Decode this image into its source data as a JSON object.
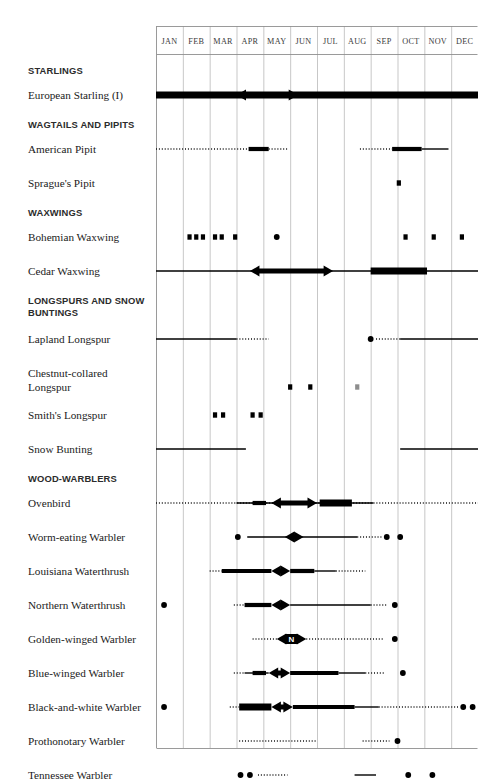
{
  "chart_data": {
    "type": "table",
    "xlabel": "",
    "ylabel": "",
    "grid": true,
    "legend_position": "none",
    "categories": [
      "JAN",
      "FEB",
      "MAR",
      "APR",
      "MAY",
      "JUN",
      "JUL",
      "AUG",
      "SEP",
      "OCT",
      "NOV",
      "DEC"
    ],
    "axis_range_months": [
      1,
      13
    ],
    "notation": {
      "thick_bar": "abundant / common",
      "thin_line": "uncommon",
      "dotted_line": "rare / occasional",
      "dot": "isolated record",
      "square": "isolated record",
      "double_arrow": "migration peak",
      "N_glyph": "nesting"
    },
    "groups": [
      {
        "group": "STARLINGS",
        "species": [
          {
            "name": "European Starling (I)",
            "marks": [
              {
                "kind": "bar",
                "start": 1.0,
                "end": 13.0,
                "weight": "thick"
              },
              {
                "kind": "arrows",
                "start": 4.0,
                "end": 6.3
              }
            ]
          }
        ]
      },
      {
        "group": "WAGTAILS AND PIPITS",
        "species": [
          {
            "name": "American Pipit",
            "marks": [
              {
                "kind": "line",
                "start": 1.0,
                "end": 4.45,
                "weight": "dotted"
              },
              {
                "kind": "bar",
                "start": 4.45,
                "end": 5.2,
                "weight": "medium"
              },
              {
                "kind": "line",
                "start": 5.2,
                "end": 5.9,
                "weight": "dotted"
              },
              {
                "kind": "line",
                "start": 8.6,
                "end": 9.8,
                "weight": "dotted"
              },
              {
                "kind": "bar",
                "start": 9.8,
                "end": 10.9,
                "weight": "medium"
              },
              {
                "kind": "line",
                "start": 10.9,
                "end": 11.9,
                "weight": "thin"
              }
            ]
          },
          {
            "name": "Sprague's Pipit",
            "marks": [
              {
                "kind": "square",
                "at": 10.05
              }
            ]
          }
        ]
      },
      {
        "group": "WAXWINGS",
        "species": [
          {
            "name": "Bohemian Waxwing",
            "marks": [
              {
                "kind": "square",
                "at": 2.25
              },
              {
                "kind": "square",
                "at": 2.5
              },
              {
                "kind": "square",
                "at": 2.75
              },
              {
                "kind": "square",
                "at": 3.2
              },
              {
                "kind": "square",
                "at": 3.45
              },
              {
                "kind": "square",
                "at": 3.95
              },
              {
                "kind": "dot",
                "at": 5.5
              },
              {
                "kind": "square",
                "at": 10.3
              },
              {
                "kind": "square",
                "at": 11.35
              },
              {
                "kind": "square",
                "at": 12.4
              }
            ]
          },
          {
            "name": "Cedar Waxwing",
            "marks": [
              {
                "kind": "line",
                "start": 1.0,
                "end": 13.0,
                "weight": "thin"
              },
              {
                "kind": "arrows",
                "start": 4.5,
                "end": 7.6
              },
              {
                "kind": "bar",
                "start": 9.0,
                "end": 11.1,
                "weight": "thick"
              }
            ]
          }
        ]
      },
      {
        "group": "LONGSPURS AND SNOW BUNTINGS",
        "species": [
          {
            "name": "Lapland Longspur",
            "marks": [
              {
                "kind": "line",
                "start": 1.0,
                "end": 4.0,
                "weight": "thin"
              },
              {
                "kind": "line",
                "start": 4.0,
                "end": 5.2,
                "weight": "dotted"
              },
              {
                "kind": "dot",
                "at": 9.0
              },
              {
                "kind": "line",
                "start": 9.2,
                "end": 10.1,
                "weight": "dotted"
              },
              {
                "kind": "line",
                "start": 10.1,
                "end": 13.0,
                "weight": "thin"
              }
            ]
          },
          {
            "name": "Chestnut-collared Longspur",
            "marks": [
              {
                "kind": "square",
                "at": 6.0
              },
              {
                "kind": "square",
                "at": 6.75
              },
              {
                "kind": "square",
                "at": 8.5,
                "faint": true
              }
            ]
          },
          {
            "name": "Smith's Longspur",
            "marks": [
              {
                "kind": "square",
                "at": 3.2
              },
              {
                "kind": "square",
                "at": 3.5
              },
              {
                "kind": "square",
                "at": 4.6
              },
              {
                "kind": "square",
                "at": 4.9
              }
            ]
          },
          {
            "name": "Snow Bunting",
            "marks": [
              {
                "kind": "line",
                "start": 1.0,
                "end": 4.35,
                "weight": "thin"
              },
              {
                "kind": "line",
                "start": 10.1,
                "end": 13.0,
                "weight": "thin"
              }
            ]
          }
        ]
      },
      {
        "group": "WOOD-WARBLERS",
        "species": [
          {
            "name": "Ovenbird",
            "marks": [
              {
                "kind": "line",
                "start": 1.0,
                "end": 13.0,
                "weight": "dotted"
              },
              {
                "kind": "line",
                "start": 4.0,
                "end": 9.1,
                "weight": "thin"
              },
              {
                "kind": "bar",
                "start": 4.6,
                "end": 5.1,
                "weight": "medium"
              },
              {
                "kind": "arrows",
                "start": 5.3,
                "end": 7.0
              },
              {
                "kind": "bar",
                "start": 7.1,
                "end": 8.3,
                "weight": "thick"
              }
            ]
          },
          {
            "name": "Worm-eating Warbler",
            "marks": [
              {
                "kind": "dot",
                "at": 4.05
              },
              {
                "kind": "line",
                "start": 4.4,
                "end": 8.5,
                "weight": "thin"
              },
              {
                "kind": "arrows",
                "start": 5.8,
                "end": 6.5
              },
              {
                "kind": "line",
                "start": 8.5,
                "end": 9.4,
                "weight": "dotted"
              },
              {
                "kind": "dot",
                "at": 9.6
              },
              {
                "kind": "dot",
                "at": 10.1
              }
            ]
          },
          {
            "name": "Louisiana Waterthrush",
            "marks": [
              {
                "kind": "line",
                "start": 3.0,
                "end": 3.45,
                "weight": "dotted"
              },
              {
                "kind": "bar",
                "start": 3.45,
                "end": 5.3,
                "weight": "medium"
              },
              {
                "kind": "arrows",
                "start": 5.3,
                "end": 6.0
              },
              {
                "kind": "bar",
                "start": 6.0,
                "end": 6.9,
                "weight": "medium"
              },
              {
                "kind": "line",
                "start": 6.9,
                "end": 7.7,
                "weight": "thin"
              },
              {
                "kind": "line",
                "start": 7.7,
                "end": 8.8,
                "weight": "dotted"
              }
            ]
          },
          {
            "name": "Northern Waterthrush",
            "marks": [
              {
                "kind": "dot",
                "at": 1.3
              },
              {
                "kind": "line",
                "start": 3.9,
                "end": 4.3,
                "weight": "dotted"
              },
              {
                "kind": "bar",
                "start": 4.3,
                "end": 5.3,
                "weight": "medium"
              },
              {
                "kind": "arrows",
                "start": 5.3,
                "end": 6.0
              },
              {
                "kind": "line",
                "start": 6.0,
                "end": 9.0,
                "weight": "thin"
              },
              {
                "kind": "line",
                "start": 9.0,
                "end": 9.6,
                "weight": "dotted"
              },
              {
                "kind": "dot",
                "at": 9.9
              }
            ]
          },
          {
            "name": "Golden-winged Warbler",
            "marks": [
              {
                "kind": "line",
                "start": 4.6,
                "end": 5.5,
                "weight": "dotted"
              },
              {
                "kind": "nest_arrows",
                "start": 5.5,
                "end": 6.6
              },
              {
                "kind": "line",
                "start": 6.6,
                "end": 9.5,
                "weight": "dotted"
              },
              {
                "kind": "dot",
                "at": 9.9
              }
            ]
          },
          {
            "name": "Blue-winged Warbler",
            "marks": [
              {
                "kind": "line",
                "start": 3.9,
                "end": 4.3,
                "weight": "dotted"
              },
              {
                "kind": "line",
                "start": 4.3,
                "end": 5.2,
                "weight": "thin"
              },
              {
                "kind": "bar",
                "start": 4.6,
                "end": 5.1,
                "weight": "medium"
              },
              {
                "kind": "arrows",
                "start": 5.2,
                "end": 6.0
              },
              {
                "kind": "bar",
                "start": 6.0,
                "end": 7.8,
                "weight": "medium"
              },
              {
                "kind": "line",
                "start": 7.8,
                "end": 8.8,
                "weight": "thin"
              },
              {
                "kind": "line",
                "start": 8.8,
                "end": 9.5,
                "weight": "dotted"
              },
              {
                "kind": "dot",
                "at": 10.2
              }
            ]
          },
          {
            "name": "Black-and-white Warbler",
            "marks": [
              {
                "kind": "dot",
                "at": 1.3
              },
              {
                "kind": "line",
                "start": 3.75,
                "end": 4.1,
                "weight": "dotted"
              },
              {
                "kind": "bar",
                "start": 4.1,
                "end": 5.3,
                "weight": "thick"
              },
              {
                "kind": "arrows",
                "start": 5.3,
                "end": 6.1
              },
              {
                "kind": "bar",
                "start": 6.1,
                "end": 8.4,
                "weight": "medium"
              },
              {
                "kind": "line",
                "start": 8.4,
                "end": 9.3,
                "weight": "thin"
              },
              {
                "kind": "line",
                "start": 9.3,
                "end": 12.3,
                "weight": "dotted"
              },
              {
                "kind": "dot",
                "at": 12.45
              },
              {
                "kind": "dot",
                "at": 12.8
              }
            ]
          },
          {
            "name": "Prothonotary Warbler",
            "marks": [
              {
                "kind": "line",
                "start": 4.1,
                "end": 7.0,
                "weight": "dotted"
              },
              {
                "kind": "line",
                "start": 8.7,
                "end": 9.7,
                "weight": "dotted"
              },
              {
                "kind": "dot",
                "at": 10.0
              }
            ]
          },
          {
            "name": "Tennessee Warbler",
            "marks": [
              {
                "kind": "dot",
                "at": 4.15
              },
              {
                "kind": "dot",
                "at": 4.5
              },
              {
                "kind": "line",
                "start": 4.8,
                "end": 5.9,
                "weight": "dotted"
              },
              {
                "kind": "line",
                "start": 8.4,
                "end": 9.2,
                "weight": "thin"
              },
              {
                "kind": "dot",
                "at": 10.4
              },
              {
                "kind": "dot",
                "at": 11.3
              }
            ]
          },
          {
            "name": "Orange-crowned Warbler",
            "marks": [
              {
                "kind": "line",
                "start": 0.9,
                "end": 5.85,
                "weight": "dotted"
              },
              {
                "kind": "line",
                "start": 9.1,
                "end": 9.8,
                "weight": "dotted"
              },
              {
                "kind": "line",
                "start": 9.8,
                "end": 11.5,
                "weight": "thin"
              },
              {
                "kind": "line",
                "start": 11.5,
                "end": 13.0,
                "weight": "dotted"
              }
            ]
          }
        ]
      }
    ]
  }
}
